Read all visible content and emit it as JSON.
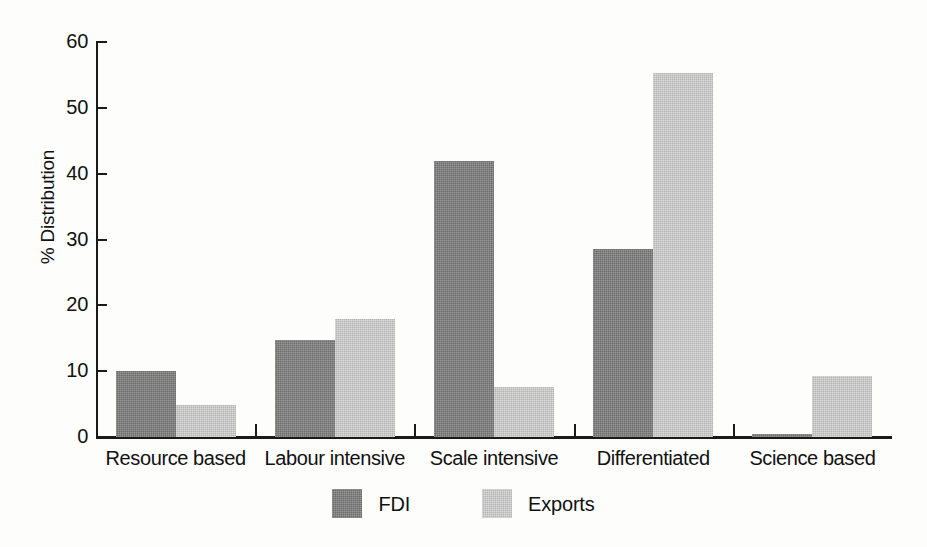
{
  "chart_data": {
    "type": "bar",
    "title": "",
    "xlabel": "",
    "ylabel": "% Distribution",
    "ylim": [
      0,
      60
    ],
    "yticks": [
      0,
      10,
      20,
      30,
      40,
      50,
      60
    ],
    "ytick_labels": [
      "0",
      "10",
      "20",
      "30",
      "40",
      "50",
      "60"
    ],
    "grid": false,
    "legend_position": "bottom-center",
    "categories": [
      "Resource based",
      "Labour intensive",
      "Scale intensive",
      "Differentiated",
      "Science based"
    ],
    "series": [
      {
        "name": "FDI",
        "color": "#6b6b6b",
        "values": [
          10.0,
          14.8,
          42.0,
          28.5,
          0.4
        ]
      },
      {
        "name": "Exports",
        "color": "#b3b3b3",
        "values": [
          4.9,
          18.0,
          7.6,
          55.3,
          9.3
        ]
      }
    ]
  },
  "axis": {
    "line_color": "#1a1a1a"
  },
  "legend": {
    "items": [
      {
        "label": "FDI",
        "swatch": "fdi-swatch"
      },
      {
        "label": "Exports",
        "swatch": "exports-swatch"
      }
    ]
  }
}
